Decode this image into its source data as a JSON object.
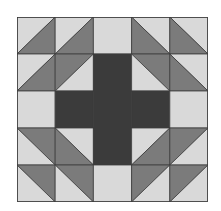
{
  "colors": {
    "light": "#d9d9d9",
    "medium": "#7b7b7b",
    "dark": "#3b3b3b",
    "seam": "#3c3c3c"
  },
  "grid": {
    "rows": 5,
    "cols": 5
  },
  "cells": [
    [
      {
        "type": "hst",
        "diag": "bl-tr",
        "a": "light",
        "b": "medium"
      },
      {
        "type": "hst",
        "diag": "bl-tr",
        "a": "light",
        "b": "medium"
      },
      {
        "type": "solid",
        "fill": "light"
      },
      {
        "type": "hst",
        "diag": "tl-br",
        "a": "light",
        "b": "medium"
      },
      {
        "type": "hst",
        "diag": "tl-br",
        "a": "light",
        "b": "medium"
      }
    ],
    [
      {
        "type": "hst",
        "diag": "bl-tr",
        "a": "light",
        "b": "medium"
      },
      {
        "type": "hst",
        "diag": "bl-tr",
        "a": "medium",
        "b": "light"
      },
      {
        "type": "solid",
        "fill": "dark"
      },
      {
        "type": "hst",
        "diag": "tl-br",
        "a": "medium",
        "b": "light"
      },
      {
        "type": "hst",
        "diag": "tl-br",
        "a": "light",
        "b": "medium"
      }
    ],
    [
      {
        "type": "solid",
        "fill": "light"
      },
      {
        "type": "solid",
        "fill": "dark"
      },
      {
        "type": "solid",
        "fill": "dark"
      },
      {
        "type": "solid",
        "fill": "dark"
      },
      {
        "type": "solid",
        "fill": "light"
      }
    ],
    [
      {
        "type": "hst",
        "diag": "tl-br",
        "a": "medium",
        "b": "light"
      },
      {
        "type": "hst",
        "diag": "tl-br",
        "a": "light",
        "b": "medium"
      },
      {
        "type": "solid",
        "fill": "dark"
      },
      {
        "type": "hst",
        "diag": "bl-tr",
        "a": "light",
        "b": "medium"
      },
      {
        "type": "hst",
        "diag": "bl-tr",
        "a": "medium",
        "b": "light"
      }
    ],
    [
      {
        "type": "hst",
        "diag": "tl-br",
        "a": "medium",
        "b": "light"
      },
      {
        "type": "hst",
        "diag": "tl-br",
        "a": "medium",
        "b": "light"
      },
      {
        "type": "solid",
        "fill": "light"
      },
      {
        "type": "hst",
        "diag": "bl-tr",
        "a": "medium",
        "b": "light"
      },
      {
        "type": "hst",
        "diag": "bl-tr",
        "a": "medium",
        "b": "light"
      }
    ]
  ]
}
